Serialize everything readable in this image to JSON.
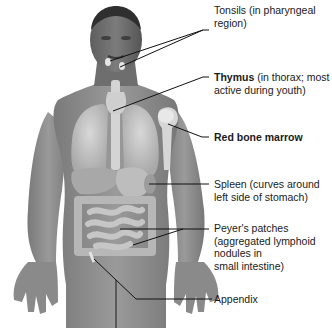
{
  "diagram": {
    "colors": {
      "skin_dark": "#6b6b6b",
      "skin_mid": "#8e8e8e",
      "skin_light": "#b5b5b5",
      "organ": "#c8c8c8",
      "organ_light": "#dcdcdc",
      "leader_line": "#111111",
      "text": "#1a1a1a"
    },
    "labels": [
      {
        "id": "tonsils",
        "bold": "",
        "text": "Tonsils (in pharyngeal",
        "text2": "region)"
      },
      {
        "id": "thymus",
        "bold": "Thymus",
        "text": " (in thorax; most",
        "text2": "active during youth)"
      },
      {
        "id": "red-bone-marrow",
        "bold": "Red bone marrow",
        "text": "",
        "text2": ""
      },
      {
        "id": "spleen",
        "bold": "",
        "text": "Spleen (curves around",
        "text2": "left side of stomach)"
      },
      {
        "id": "peyers-patches",
        "bold": "",
        "text": "Peyer's patches",
        "text2": "(aggregated lymphoid",
        "text3": "nodules in",
        "text4": "small intestine)"
      },
      {
        "id": "appendix",
        "bold": "",
        "text": "Appendix",
        "text2": ""
      }
    ]
  }
}
